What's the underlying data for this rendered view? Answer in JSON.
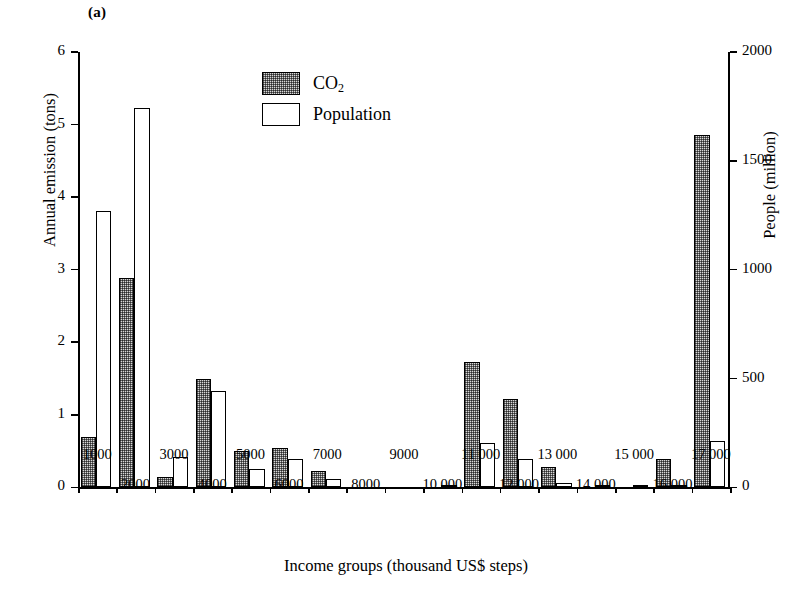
{
  "panel": {
    "label": "(a)"
  },
  "legend": {
    "position": "top-center",
    "items": [
      {
        "key": "co2",
        "label_main": "CO",
        "label_sub": "2",
        "swatch": "stippled-gray"
      },
      {
        "key": "population",
        "label_main": "Population",
        "label_sub": "",
        "swatch": "white-outline"
      }
    ]
  },
  "chart_data": {
    "type": "bar",
    "title": "",
    "subtitle": "",
    "xlabel": "Income groups (thousand US$ steps)",
    "ylabel": "Annual emission (tons)",
    "ylabel_right": "People (million)",
    "grid": false,
    "legend_position": "top-center",
    "ylim": [
      0,
      6
    ],
    "ylim_right": [
      0,
      2000
    ],
    "yticks": [
      0,
      1,
      2,
      3,
      4,
      5,
      6
    ],
    "yticklabels": [
      "0",
      "1",
      "2",
      "3",
      "4",
      "5",
      "6"
    ],
    "yticks_right": [
      0,
      500,
      1000,
      1500,
      2000
    ],
    "yticklabels_right": [
      "0",
      "500",
      "1000",
      "1500",
      "2000"
    ],
    "categories": [
      "1000",
      "2000",
      "3000",
      "4000",
      "5000",
      "6000",
      "7000",
      "8000",
      "9000",
      "10 000",
      "11 000",
      "12 000",
      "13 000",
      "14 000",
      "15 000",
      "16 000",
      "17 000"
    ],
    "xticklabels_row0": [
      "1000",
      "",
      "3000",
      "",
      "5000",
      "",
      "7000",
      "",
      "9000",
      "",
      "11 000",
      "",
      "13 000",
      "",
      "15 000",
      "",
      "17 000"
    ],
    "xticklabels_row1": [
      "",
      "2000",
      "",
      "4000",
      "",
      "6000",
      "",
      "8000",
      "",
      "10 000",
      "",
      "12 000",
      "",
      "14 000",
      "",
      "16 000",
      ""
    ],
    "series": [
      {
        "name": "CO2",
        "axis": "left",
        "unit": "tons",
        "values": [
          0.69,
          2.88,
          0.15,
          1.5,
          0.5,
          0.54,
          0.23,
          0.0,
          0.0,
          0.0,
          1.73,
          1.22,
          0.28,
          0.0,
          0.0,
          0.39,
          4.85
        ]
      },
      {
        "name": "Population",
        "axis": "right",
        "unit": "million",
        "values": [
          1270,
          1745,
          140,
          445,
          85,
          130,
          38,
          0,
          0,
          12,
          205,
          130,
          20,
          12,
          8,
          12,
          212
        ]
      }
    ]
  }
}
